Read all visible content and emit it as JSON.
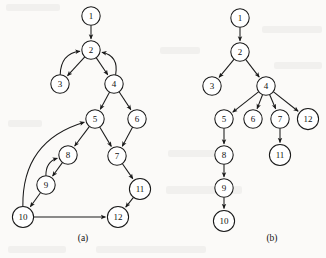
{
  "figure": {
    "width": 326,
    "height": 258,
    "background_color": "#fbfaf8",
    "ink_color": "#1a1a1a",
    "node_fill_color": "#ffffff",
    "node_radius": 9.2
  },
  "panels": [
    {
      "id": "panel-a",
      "caption": "(a)",
      "caption_position": {
        "x": 83,
        "y": 238
      },
      "kind": "directed-graph",
      "description": "directed graph with back edges",
      "nodes": [
        {
          "id": "1",
          "label": "1",
          "x": 91,
          "y": 16
        },
        {
          "id": "2",
          "label": "2",
          "x": 91,
          "y": 50
        },
        {
          "id": "3",
          "label": "3",
          "x": 60,
          "y": 84
        },
        {
          "id": "4",
          "label": "4",
          "x": 114,
          "y": 84
        },
        {
          "id": "5",
          "label": "5",
          "x": 95,
          "y": 119
        },
        {
          "id": "6",
          "label": "6",
          "x": 137,
          "y": 119
        },
        {
          "id": "7",
          "label": "7",
          "x": 117,
          "y": 156
        },
        {
          "id": "8",
          "label": "8",
          "x": 68,
          "y": 155
        },
        {
          "id": "9",
          "label": "9",
          "x": 46,
          "y": 185
        },
        {
          "id": "10",
          "label": "10",
          "x": 23,
          "y": 217
        },
        {
          "id": "11",
          "label": "11",
          "x": 140,
          "y": 189
        },
        {
          "id": "12",
          "label": "12",
          "x": 118,
          "y": 217
        }
      ],
      "edges": [
        {
          "from": "1",
          "to": "2",
          "style": "straight"
        },
        {
          "from": "2",
          "to": "3",
          "style": "straight"
        },
        {
          "from": "2",
          "to": "4",
          "style": "straight"
        },
        {
          "from": "3",
          "to": "2",
          "style": "curved",
          "bow": -20
        },
        {
          "from": "4",
          "to": "2",
          "style": "curved",
          "bow": 20
        },
        {
          "from": "4",
          "to": "5",
          "style": "straight"
        },
        {
          "from": "4",
          "to": "6",
          "style": "straight"
        },
        {
          "from": "5",
          "to": "7",
          "style": "straight"
        },
        {
          "from": "6",
          "to": "7",
          "style": "straight"
        },
        {
          "from": "5",
          "to": "8",
          "style": "straight"
        },
        {
          "from": "8",
          "to": "9",
          "style": "straight"
        },
        {
          "from": "9",
          "to": "8",
          "style": "curved",
          "bow": -14
        },
        {
          "from": "9",
          "to": "10",
          "style": "straight"
        },
        {
          "from": "10",
          "to": "5",
          "style": "curved",
          "bow": -46
        },
        {
          "from": "10",
          "to": "12",
          "style": "straight"
        },
        {
          "from": "7",
          "to": "11",
          "style": "straight"
        },
        {
          "from": "11",
          "to": "12",
          "style": "straight"
        }
      ]
    },
    {
      "id": "panel-b",
      "caption": "(b)",
      "caption_position": {
        "x": 272,
        "y": 238
      },
      "kind": "tree",
      "description": "depth-first search tree of the graph in panel (a)",
      "nodes": [
        {
          "id": "1",
          "label": "1",
          "x": 240,
          "y": 18
        },
        {
          "id": "2",
          "label": "2",
          "x": 240,
          "y": 52
        },
        {
          "id": "3",
          "label": "3",
          "x": 212,
          "y": 86
        },
        {
          "id": "4",
          "label": "4",
          "x": 266,
          "y": 86
        },
        {
          "id": "5",
          "label": "5",
          "x": 224,
          "y": 119
        },
        {
          "id": "6",
          "label": "6",
          "x": 253,
          "y": 119
        },
        {
          "id": "7",
          "label": "7",
          "x": 280,
          "y": 119
        },
        {
          "id": "12",
          "label": "12",
          "x": 308,
          "y": 119
        },
        {
          "id": "8",
          "label": "8",
          "x": 224,
          "y": 155
        },
        {
          "id": "11",
          "label": "11",
          "x": 280,
          "y": 155
        },
        {
          "id": "9",
          "label": "9",
          "x": 224,
          "y": 188
        },
        {
          "id": "10",
          "label": "10",
          "x": 224,
          "y": 221
        }
      ],
      "edges": [
        {
          "from": "1",
          "to": "2",
          "style": "straight"
        },
        {
          "from": "2",
          "to": "3",
          "style": "straight"
        },
        {
          "from": "2",
          "to": "4",
          "style": "straight"
        },
        {
          "from": "4",
          "to": "5",
          "style": "straight"
        },
        {
          "from": "4",
          "to": "6",
          "style": "straight"
        },
        {
          "from": "4",
          "to": "7",
          "style": "straight"
        },
        {
          "from": "4",
          "to": "12",
          "style": "straight"
        },
        {
          "from": "5",
          "to": "8",
          "style": "straight"
        },
        {
          "from": "7",
          "to": "11",
          "style": "straight"
        },
        {
          "from": "8",
          "to": "9",
          "style": "straight"
        },
        {
          "from": "9",
          "to": "10",
          "style": "straight"
        }
      ]
    }
  ]
}
